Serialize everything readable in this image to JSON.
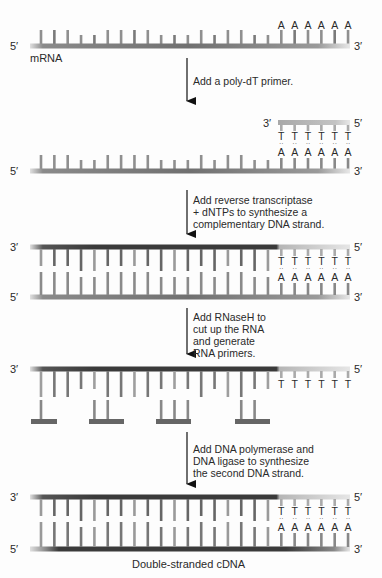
{
  "diagram": {
    "colors": {
      "rna": "#8c8c8c",
      "rna_light": "#c8c8c8",
      "dna_new": "#3a3a3a",
      "primer": "#b8b8b8",
      "text": "#2a2a2a"
    },
    "stages": [
      {
        "id": "mrna",
        "strand_label": "mRNA",
        "left_end": "5′",
        "right_end": "3′",
        "tail_bases": [
          "A",
          "A",
          "A",
          "A",
          "A",
          "A"
        ]
      },
      {
        "id": "primer-annealed",
        "primer_left_end": "3′",
        "primer_right_end": "5′",
        "primer_bases": [
          "T",
          "T",
          "T",
          "T",
          "T",
          "T"
        ],
        "pair_bases": [
          "A",
          "A",
          "A",
          "A",
          "A",
          "A"
        ],
        "left_end": "5′",
        "right_end": "3′"
      },
      {
        "id": "rna-dna-hybrid",
        "top_left_end": "3′",
        "top_right_end": "5′",
        "bottom_left_end": "5′",
        "bottom_right_end": "3′",
        "primer_bases": [
          "T",
          "T",
          "T",
          "T",
          "T",
          "T"
        ],
        "pair_bases": [
          "A",
          "A",
          "A",
          "A",
          "A",
          "A"
        ]
      },
      {
        "id": "rnaseh-cut",
        "top_left_end": "3′",
        "top_right_end": "5′",
        "primer_bases": [
          "T",
          "T",
          "T",
          "T",
          "T",
          "T"
        ]
      },
      {
        "id": "double-stranded",
        "top_left_end": "3′",
        "top_right_end": "5′",
        "bottom_left_end": "5′",
        "bottom_right_end": "3′",
        "primer_bases": [
          "T",
          "T",
          "T",
          "T",
          "T",
          "T"
        ],
        "pair_bases": [
          "A",
          "A",
          "A",
          "A",
          "A",
          "A"
        ],
        "caption": "Double-stranded cDNA"
      }
    ],
    "steps": [
      {
        "text": "Add a poly-dT primer."
      },
      {
        "text": "Add reverse transcriptase\n+ dNTPs to synthesize a\ncomplementary DNA strand."
      },
      {
        "text": "Add RNaseH to\ncut up the RNA\nand generate\nRNA primers."
      },
      {
        "text": "Add DNA polymerase and\nDNA ligase to synthesize\nthe second DNA strand."
      }
    ]
  }
}
